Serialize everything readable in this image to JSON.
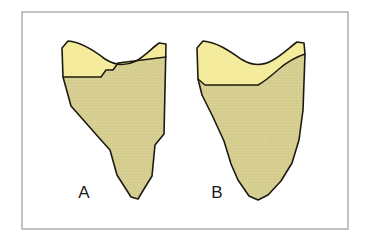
{
  "figure": {
    "name": "two-panel-bone-fragment-diagram",
    "background_color": "#ffffff",
    "frame": {
      "name": "figure-border",
      "stroke_color": "#9a9a9a",
      "fill_color": "#ffffff",
      "x": 22,
      "y": 12,
      "width": 326,
      "height": 217
    },
    "colors": {
      "outline": "#1d1b11",
      "cartilage_light_yellow": "#F4EC9C",
      "bone_textured_tan": "#DBD296",
      "texture_line": "#CCC185",
      "label_text": "#1a1a1a",
      "frame_gray": "#9a9a9a"
    },
    "panels": [
      {
        "id": "panel-a",
        "label": "A",
        "label_x": 84,
        "label_y": 198,
        "regions": [
          {
            "name": "cartilage-region",
            "fill": "cartilage_light_yellow",
            "textured": false
          },
          {
            "name": "bone-region",
            "fill": "bone_textured_tan",
            "textured": true
          }
        ]
      },
      {
        "id": "panel-b",
        "label": "B",
        "label_x": 217,
        "label_y": 198,
        "regions": [
          {
            "name": "cartilage-region",
            "fill": "cartilage_light_yellow",
            "textured": false
          },
          {
            "name": "bone-region",
            "fill": "bone_textured_tan",
            "textured": true
          }
        ]
      }
    ],
    "paths": {
      "panel_a_cartilage": "M 62 48 L 68 41 C 82 42 96 52 105 59 C 116 66 126 66 136 61 C 145 56 152 48 159 43 L 166 44 L 166 57 L 118 63 L 113 70 L 106 70 L 101 77 L 63 77 Z",
      "panel_a_bone": "M 63 77 L 101 77 L 106 70 L 113 70 L 118 63 L 166 57 L 164 134 L 155 145 L 152 176 L 144 189 L 138 199 L 131 197 L 117 175 L 110 150 L 101 140 L 71 106 Z",
      "panel_a_outline": "M 62 48 L 68 41 C 82 42 96 52 105 59 C 116 66 126 66 136 61 C 145 56 152 48 159 43 L 166 44 L 164 134 L 155 145 L 152 176 L 144 189 L 138 199 L 131 197 L 117 175 L 110 150 L 101 140 L 71 106 L 63 77 Z",
      "panel_a_divider": "M 63 77 L 101 77 L 106 70 L 113 70 L 118 63 L 166 57",
      "panel_b_cartilage": "M 197 48 L 203 41 C 217 42 231 52 241 59 C 252 66 263 66 273 60 C 282 55 290 47 297 42 L 304 43 L 305 54 C 296 57 287 62 279 69 C 271 76 264 82 258 85 L 205 85 L 198 79 Z",
      "panel_b_bone": "M 198 79 L 205 85 L 258 85 C 264 82 271 76 279 69 C 287 62 296 57 305 54 L 303 110 L 299 140 L 292 163 L 281 181 L 268 195 L 258 200 L 249 196 L 238 180 L 231 164 L 224 141 L 212 115 L 202 95 Z",
      "panel_b_outline": "M 197 48 L 203 41 C 217 42 231 52 241 59 C 252 66 263 66 273 60 C 282 55 290 47 297 42 L 304 43 L 305 54 L 303 110 L 299 140 L 292 163 L 281 181 L 268 195 L 258 200 L 249 196 L 238 180 L 231 164 L 224 141 L 212 115 L 202 95 L 198 79 Z",
      "panel_b_divider": "M 198 79 L 205 85 L 258 85 C 264 82 271 76 279 69 C 287 62 296 57 305 54"
    }
  }
}
